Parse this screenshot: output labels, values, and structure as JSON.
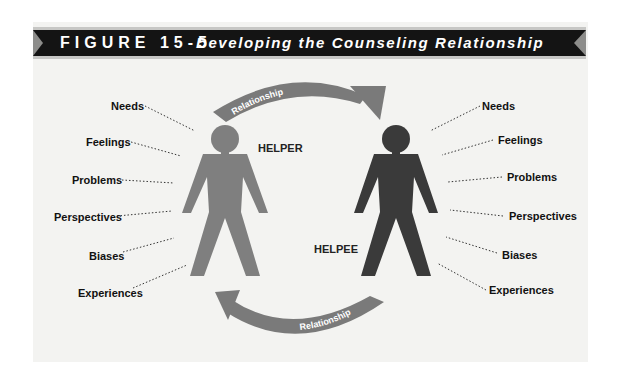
{
  "figure": {
    "number": "FIGURE 15-5",
    "title": "Developing the Counseling Relationship"
  },
  "people": {
    "helper": {
      "label": "HELPER",
      "color": "#7f7f7f"
    },
    "helpee": {
      "label": "HELPEE",
      "color": "#3a3a3a"
    }
  },
  "arrows": {
    "top": {
      "label": "Relationship",
      "direction": "helper-to-helpee"
    },
    "bottom": {
      "label": "Relationship",
      "direction": "helpee-to-helper"
    },
    "color": "#7a7a7a"
  },
  "left_attributes": [
    "Needs",
    "Feelings",
    "Problems",
    "Perspectives",
    "Biases",
    "Experiences"
  ],
  "right_attributes": [
    "Needs",
    "Feelings",
    "Problems",
    "Perspectives",
    "Biases",
    "Experiences"
  ],
  "colors": {
    "header_bar": "#141414",
    "panel": "#f3f3f1",
    "notch": "#8d8d8b"
  }
}
